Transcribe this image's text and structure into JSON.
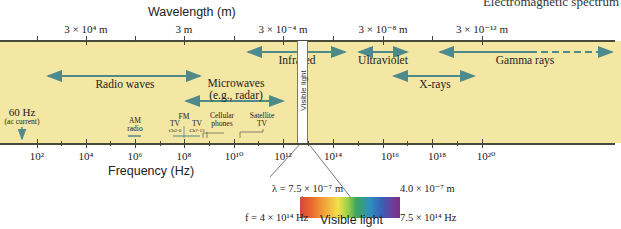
{
  "title": "Electromagnetic spectrum",
  "wavelength_axis": {
    "title": "Wavelength (m)",
    "labels": [
      {
        "text": "3 × 10⁴ m",
        "x": 86
      },
      {
        "text": "3 m",
        "x": 184
      },
      {
        "text": "3 × 10⁻⁴ m",
        "x": 283
      },
      {
        "text": "3 × 10⁻⁸ m",
        "x": 383
      },
      {
        "text": "3 × 10⁻¹² m",
        "x": 482
      }
    ]
  },
  "frequency_axis": {
    "title": "Frequency (Hz)",
    "labels": [
      {
        "text": "10²",
        "x": 37
      },
      {
        "text": "10⁴",
        "x": 86
      },
      {
        "text": "10⁶",
        "x": 135
      },
      {
        "text": "10⁸",
        "x": 184
      },
      {
        "text": "10¹⁰",
        "x": 234
      },
      {
        "text": "10¹²",
        "x": 283
      },
      {
        "text": "10¹⁴",
        "x": 333
      },
      {
        "text": "10¹⁶",
        "x": 383
      },
      {
        "text": "10¹⁸",
        "x": 432
      },
      {
        "text": "10²⁰",
        "x": 482
      }
    ]
  },
  "bands": {
    "radio": "Radio waves",
    "microwaves_line1": "Microwaves",
    "microwaves_line2": "(e.g., radar)",
    "infrared": "Infrared",
    "visible_strip": "Visible light",
    "ultraviolet": "Ultraviolet",
    "xrays": "X-rays",
    "gamma": "Gamma rays"
  },
  "annotations": {
    "hz60_line1": "60 Hz",
    "hz60_line2": "(ac current)",
    "am_line1": "AM",
    "am_line2": "radio",
    "fm": "FM",
    "tv1": "TV",
    "tv1_sub": "Ch2-6",
    "tv2": "TV",
    "tv2_sub": "Ch7-13",
    "cell_line1": "Cellular",
    "cell_line2": "phones",
    "sat_line1": "Satellite",
    "sat_line2": "TV"
  },
  "visible_detail": {
    "lambda_red": "λ = 7.5 × 10⁻⁷ m",
    "lambda_violet": "4.0 × 10⁻⁷ m",
    "f_red": "f = 4 × 10¹⁴ Hz",
    "f_violet": "7.5 × 10¹⁴ Hz",
    "caption": "Visible light"
  },
  "colors": {
    "band_background": "#f4e6a3",
    "arrow": "#4f8a8b"
  }
}
